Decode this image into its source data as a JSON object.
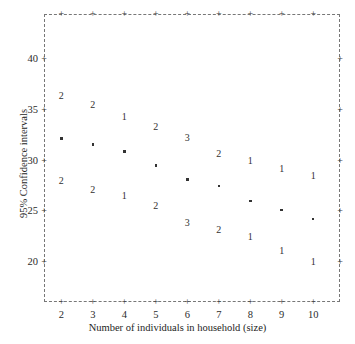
{
  "chart_data": {
    "type": "scatter",
    "title": "",
    "xlabel": "Number of individuals in household (size)",
    "ylabel": "95% Confidence intervals",
    "xlim": [
      1.45,
      10.85
    ],
    "ylim": [
      16.0,
      44.5
    ],
    "xticks": [
      2,
      3,
      4,
      5,
      6,
      7,
      8,
      9,
      10
    ],
    "xtick_labels": [
      "2",
      "3",
      "4",
      "5",
      "6",
      "7",
      "8",
      "9",
      "10"
    ],
    "yticks": [
      20,
      25,
      30,
      35,
      40
    ],
    "ytick_labels": [
      "20",
      "25",
      "30",
      "35",
      "40"
    ],
    "grid": false,
    "frame_style": "dashed",
    "legend": "none",
    "categories": [
      "2",
      "3",
      "4",
      "5",
      "6",
      "7",
      "8",
      "9",
      "10"
    ],
    "series": [
      {
        "name": "Upper bound",
        "marker": "digit-label",
        "values": [
          36.4,
          35.5,
          34.3,
          33.3,
          32.2,
          30.6,
          30.0,
          29.2,
          28.5
        ],
        "labels": [
          "2",
          "2",
          "1",
          "2",
          "3",
          "2",
          "1",
          "1",
          "1"
        ]
      },
      {
        "name": "Mean estimate",
        "marker": "dot",
        "values": [
          32.2,
          31.6,
          30.9,
          29.5,
          28.1,
          27.5,
          26.0,
          25.1,
          24.2
        ],
        "labels": [
          "",
          "",
          "",
          "",
          "",
          "",
          "",
          "",
          ""
        ]
      },
      {
        "name": "Lower bound",
        "marker": "digit-label",
        "values": [
          28.0,
          27.1,
          26.5,
          25.5,
          23.8,
          23.1,
          22.4,
          21.0,
          20.0
        ],
        "labels": [
          "2",
          "2",
          "1",
          "2",
          "3",
          "2",
          "1",
          "1",
          "1"
        ]
      }
    ],
    "points": [
      {
        "x": 2,
        "upper": 36.4,
        "mean": 32.2,
        "lower": 28.0,
        "upper_label": "2",
        "lower_label": "2"
      },
      {
        "x": 3,
        "upper": 35.5,
        "mean": 31.6,
        "lower": 27.1,
        "upper_label": "2",
        "lower_label": "2"
      },
      {
        "x": 4,
        "upper": 34.3,
        "mean": 30.9,
        "lower": 26.5,
        "upper_label": "1",
        "lower_label": "1"
      },
      {
        "x": 5,
        "upper": 33.3,
        "mean": 29.5,
        "lower": 25.5,
        "upper_label": "2",
        "lower_label": "2"
      },
      {
        "x": 6,
        "upper": 32.2,
        "mean": 28.1,
        "lower": 23.8,
        "upper_label": "3",
        "lower_label": "3"
      },
      {
        "x": 7,
        "upper": 30.6,
        "mean": 27.5,
        "lower": 23.1,
        "upper_label": "2",
        "lower_label": "2"
      },
      {
        "x": 8,
        "upper": 30.0,
        "mean": 26.0,
        "lower": 22.4,
        "upper_label": "1",
        "lower_label": "1"
      },
      {
        "x": 9,
        "upper": 29.2,
        "mean": 25.1,
        "lower": 21.0,
        "upper_label": "1",
        "lower_label": "1"
      },
      {
        "x": 10,
        "upper": 28.5,
        "mean": 24.2,
        "lower": 20.0,
        "upper_label": "1",
        "lower_label": "1"
      }
    ],
    "frame_tick_glyph": "+"
  },
  "colors": {
    "background": "#ffffff",
    "frame": "#777777",
    "text": "#1d1d1d",
    "marker": "#333333"
  }
}
